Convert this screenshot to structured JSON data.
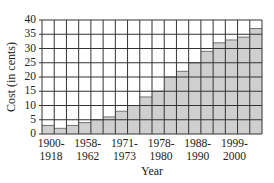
{
  "chart_data": {
    "type": "bar",
    "title": "",
    "xlabel": "Year",
    "ylabel": "Cost (in cents)",
    "ylim": [
      0,
      40
    ],
    "yticks": [
      0,
      5,
      10,
      15,
      20,
      25,
      30,
      35,
      40
    ],
    "grid": true,
    "legend": null,
    "bar_color": "#cfcfcf",
    "categories": [
      "1900-1918",
      "",
      "",
      "1958-1962",
      "",
      "",
      "1971-1973",
      "",
      "",
      "1978-1980",
      "",
      "",
      "1988-1990",
      "",
      "",
      "1999-2000",
      "",
      ""
    ],
    "x_tick_labels": [
      {
        "bar_index": 0,
        "line1": "1900-",
        "line2": "1918"
      },
      {
        "bar_index": 3,
        "line1": "1958-",
        "line2": "1962"
      },
      {
        "bar_index": 6,
        "line1": "1971-",
        "line2": "1973"
      },
      {
        "bar_index": 9,
        "line1": "1978-",
        "line2": "1980"
      },
      {
        "bar_index": 12,
        "line1": "1988-",
        "line2": "1990"
      },
      {
        "bar_index": 15,
        "line1": "1999-",
        "line2": "2000"
      }
    ],
    "values": [
      3,
      2,
      3,
      4,
      5,
      6,
      8,
      10,
      13,
      15,
      20,
      22,
      25,
      29,
      32,
      33,
      34,
      37
    ]
  }
}
